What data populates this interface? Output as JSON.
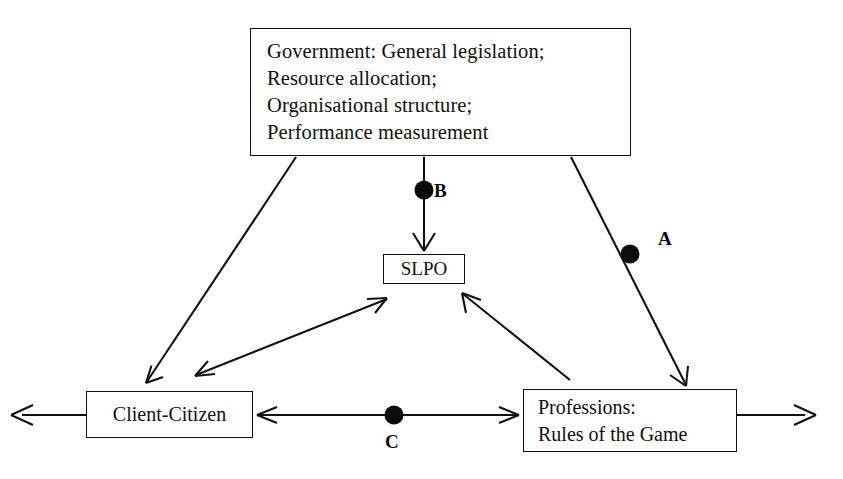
{
  "diagram": {
    "background_color": "#ffffff",
    "line_color": "#111111",
    "text_color": "#101010",
    "nodes": {
      "government": {
        "label": "Government: General legislation;\nResource allocation;\nOrganisational structure;\nPerformance measurement",
        "lines": [
          "Government: General legislation;",
          "Resource allocation;",
          "Organisational structure;",
          "Performance measurement"
        ]
      },
      "slpo": {
        "label": "SLPO"
      },
      "client_citizen": {
        "label": "Client-Citizen"
      },
      "professions": {
        "label": "Professions:\nRules of the Game",
        "lines": [
          "Professions:",
          "Rules of the Game"
        ]
      }
    },
    "edge_labels": {
      "a": "A",
      "b": "B",
      "c": "C"
    },
    "edges": [
      {
        "id": "government-to-client-citizen",
        "from": "government",
        "to": "client_citizen",
        "arrowheads": "to",
        "marker_label": null
      },
      {
        "id": "government-to-slpo",
        "from": "government",
        "to": "slpo",
        "arrowheads": "to",
        "marker_label": "B"
      },
      {
        "id": "government-to-professions",
        "from": "government",
        "to": "professions",
        "arrowheads": "to",
        "marker_label": "A"
      },
      {
        "id": "client-citizen-to-slpo",
        "from": "client_citizen",
        "to": "slpo",
        "arrowheads": "both",
        "marker_label": null
      },
      {
        "id": "professions-to-slpo",
        "from": "professions",
        "to": "slpo",
        "arrowheads": "to",
        "marker_label": null
      },
      {
        "id": "client-citizen-to-professions",
        "from": "client_citizen",
        "to": "professions",
        "arrowheads": "both",
        "marker_label": "C"
      },
      {
        "id": "client-citizen-outward-left",
        "from": "client_citizen",
        "to": "external-left",
        "arrowheads": "to",
        "marker_label": null
      },
      {
        "id": "professions-outward-right",
        "from": "professions",
        "to": "external-right",
        "arrowheads": "to",
        "marker_label": null
      }
    ]
  }
}
